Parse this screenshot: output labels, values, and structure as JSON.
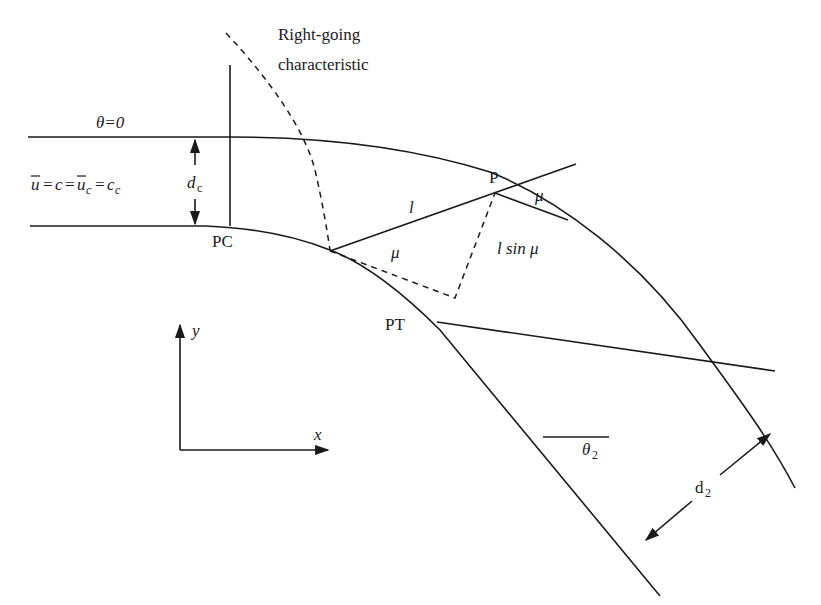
{
  "figure": {
    "type": "supercritical channel bend diagram",
    "labels": {
      "characteristic_line1": "Right-going",
      "characteristic_line2": "characteristic",
      "theta_zero": "θ=0",
      "flow_condition": "u̅=c=u̅c=cc",
      "flow_u": "u",
      "flow_eq1": "=",
      "flow_c": "c",
      "flow_eq2": "=",
      "flow_uc": "u",
      "flow_uc_sub": "c",
      "flow_eq3": "=",
      "flow_cc": "c",
      "flow_cc_sub": "c",
      "depth_critical": "d",
      "depth_critical_sub": "c",
      "point_pc": "PC",
      "point_pt": "PT",
      "point_p": "P",
      "length_l": "l",
      "angle_mu_lower": "μ",
      "angle_mu_upper": "μ",
      "l_sin_mu": "l sin μ",
      "axis_y": "y",
      "axis_x": "x",
      "theta_2": "θ",
      "theta_2_sub": "2",
      "depth_2": "d",
      "depth_2_sub": "2"
    },
    "colors": {
      "stroke": "#1a1a1a",
      "background": "#ffffff"
    }
  }
}
